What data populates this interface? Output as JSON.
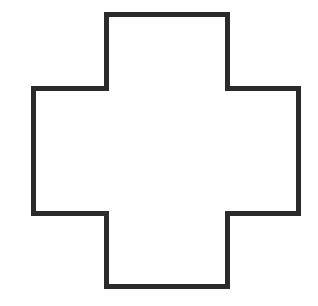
{
  "figure": {
    "shape": "cross-outline",
    "stroke_color": "#2b2b2b",
    "fill_color": "#ffffff",
    "background": "#ffffff",
    "stroke_width": 5,
    "points": "106.5,14.5 227.5,14.5 227.5,88.5 298.5,88.5 298.5,213.5 227.5,213.5 227.5,286.5 106.5,286.5 106.5,213.5 33.5,213.5 33.5,88.5 106.5,88.5"
  }
}
